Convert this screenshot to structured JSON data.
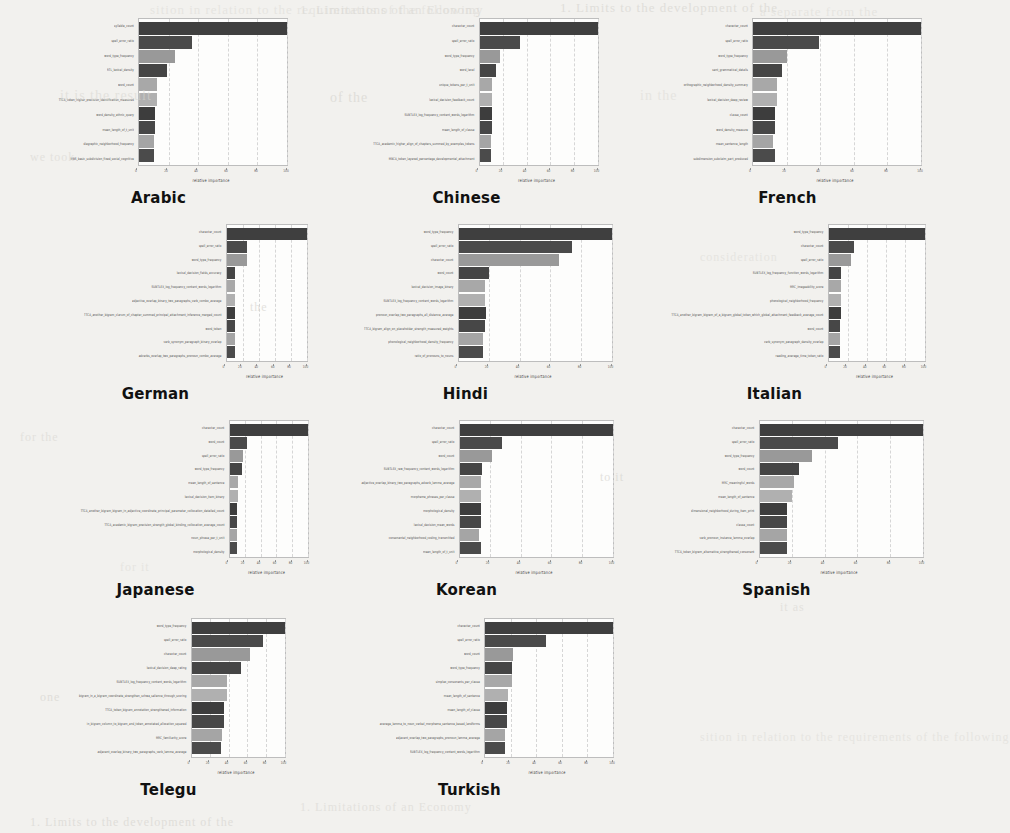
{
  "page": {
    "background_color": "#f2f1ee",
    "bleed_through_lines": [
      "sition in relation to the requirements of the following",
      "1. Limitations of an Economy",
      "1. Limits to the development of the",
      "a separate from the",
      "it is the result",
      "of the",
      "in the",
      "we took",
      "the",
      "consideration",
      "for the",
      "to it",
      "for it",
      "it as",
      "one"
    ]
  },
  "figure": {
    "type": "small-multiples",
    "n_panels": 11,
    "columns": 3,
    "shared_xlabel": "relative importance",
    "bar_palette": [
      "#3f3f3f",
      "#4a4a4a",
      "#999999",
      "#454545",
      "#a8a8a8",
      "#b0b0b0",
      "#3d3d3d",
      "#474747",
      "#a5a5a5",
      "#4b4b4b"
    ],
    "axis_color": "#bdbdbd",
    "grid_color": "#d6d6d6"
  },
  "chart_data": [
    {
      "type": "bar",
      "orientation": "horizontal",
      "title": "Arabic",
      "xlabel": "relative importance",
      "ylabel": "",
      "xlim": [
        0,
        100
      ],
      "xticks": [
        0,
        20,
        40,
        60,
        80,
        100
      ],
      "grid": true,
      "categories": [
        "syllable_count",
        "spell_error_ratio",
        "word_type_frequency",
        "RTL_lexical_density",
        "word_count",
        "TTCA_token_higher_precision_identification_measured",
        "word_density_ethnic_query",
        "mean_length_of_t_unit",
        "diagraphic_neighborhood_frequency",
        "MBS_basic_subdivision_fixed_social_cognitive"
      ],
      "values": [
        100,
        36,
        24,
        19,
        12,
        12,
        11,
        11,
        10,
        10
      ]
    },
    {
      "type": "bar",
      "orientation": "horizontal",
      "title": "Chinese",
      "xlabel": "relative importance",
      "ylabel": "",
      "xlim": [
        0,
        100
      ],
      "xticks": [
        0,
        20,
        40,
        60,
        80,
        100
      ],
      "grid": true,
      "categories": [
        "character_count",
        "spell_error_ratio",
        "word_type_frequency",
        "word_level",
        "unique_tokens_per_t_unit",
        "lexical_decision_feedback_count",
        "SUBTLEX_log_frequency_content_words_logarithm",
        "mean_length_of_clause",
        "TTCA_academic_higher_align_of_chapters_summed_by_examples_tokens",
        "MBCA_token_layered_percentage_developmental_attachment"
      ],
      "values": [
        100,
        34,
        17,
        14,
        11,
        11,
        11,
        11,
        10,
        10
      ]
    },
    {
      "type": "bar",
      "orientation": "horizontal",
      "title": "French",
      "xlabel": "relative importance",
      "ylabel": "",
      "xlim": [
        0,
        100
      ],
      "xticks": [
        0,
        20,
        40,
        60,
        80,
        100
      ],
      "grid": true,
      "categories": [
        "character_count",
        "spell_error_ratio",
        "word_type_frequency",
        "sent_grammatical_details",
        "orthographic_neighborhood_density_summary",
        "lexical_decision_deep_review",
        "clause_count",
        "word_density_measure",
        "mean_sentence_length",
        "subdimension_subclaim_part_produced"
      ],
      "values": [
        100,
        39,
        20,
        17,
        14,
        14,
        13,
        13,
        12,
        13
      ]
    },
    {
      "type": "bar",
      "orientation": "horizontal",
      "title": "German",
      "xlabel": "relative importance",
      "ylabel": "",
      "xlim": [
        0,
        100
      ],
      "xticks": [
        0,
        20,
        40,
        60,
        80,
        100
      ],
      "grid": true,
      "categories": [
        "character_count",
        "spell_error_ratio",
        "word_type_frequency",
        "lexical_decision_fields_accuracy",
        "SUBTLEX_log_frequency_content_words_logarithm",
        "adjective_overlap_binary_two_paragraphs_verb_combo_average",
        "TTCA_another_bigram_clarum_of_chapter_summed_principal_attachment_inference_merged_count",
        "word_token",
        "verb_synonym_paragraph_binary_overlap",
        "adverbs_overlap_two_paragraphs_pronoun_combo_average"
      ],
      "values": [
        100,
        26,
        25,
        11,
        11,
        11,
        11,
        11,
        10,
        10
      ]
    },
    {
      "type": "bar",
      "orientation": "horizontal",
      "title": "Hindi",
      "xlabel": "relative importance",
      "ylabel": "",
      "xlim": [
        0,
        100
      ],
      "xticks": [
        0,
        20,
        40,
        60,
        80,
        100
      ],
      "grid": true,
      "categories": [
        "word_type_frequency",
        "spell_error_ratio",
        "character_count",
        "word_count",
        "lexical_decision_image_binary",
        "SUBTLEX_log_frequency_content_words_logarithm",
        "pronoun_overlap_two_paragraphs_all_distance_average",
        "TTCA_bigram_align_on_placeholder_strength_measured_weights",
        "phonological_neighborhood_density_frequency",
        "ratio_of_pronouns_to_nouns"
      ],
      "values": [
        100,
        74,
        66,
        20,
        17,
        17,
        18,
        17,
        16,
        16
      ]
    },
    {
      "type": "bar",
      "orientation": "horizontal",
      "title": "Italian",
      "xlabel": "relative importance",
      "ylabel": "",
      "xlim": [
        0,
        100
      ],
      "xticks": [
        0,
        20,
        40,
        60,
        80,
        100
      ],
      "grid": true,
      "categories": [
        "word_type_frequency",
        "character_count",
        "spell_error_ratio",
        "SUBTLEX_log_frequency_function_words_logarithm",
        "MRC_imageability_score",
        "phonological_neighborhood_frequency",
        "TTCA_another_bigram_bigram_of_a_bigram_global_token_which_global_attachment_feedback_average_count",
        "word_count",
        "verb_synonym_paragraph_density_overlap",
        "reading_average_time_token_ratio"
      ],
      "values": [
        100,
        27,
        23,
        13,
        13,
        13,
        13,
        12,
        12,
        12
      ]
    },
    {
      "type": "bar",
      "orientation": "horizontal",
      "title": "Japanese",
      "xlabel": "relative importance",
      "ylabel": "",
      "xlim": [
        0,
        100
      ],
      "xticks": [
        0,
        20,
        40,
        60,
        80,
        100
      ],
      "grid": true,
      "categories": [
        "character_count",
        "word_count",
        "spell_error_ratio",
        "word_type_frequency",
        "mean_length_of_sentence",
        "lexical_decision_item_binary",
        "TTCA_another_bigram_bigram_in_adjective_coordinate_principal_parameter_collocation_detailed_count",
        "TTCA_academic_bigram_precision_strength_global_binding_collocation_average_count",
        "noun_phrase_per_t_unit",
        "morphological_density"
      ],
      "values": [
        100,
        22,
        17,
        16,
        11,
        11,
        10,
        10,
        10,
        10
      ]
    },
    {
      "type": "bar",
      "orientation": "horizontal",
      "title": "Korean",
      "xlabel": "relative importance",
      "ylabel": "",
      "xlim": [
        0,
        100
      ],
      "xticks": [
        0,
        20,
        40,
        60,
        80,
        100
      ],
      "grid": true,
      "categories": [
        "character_count",
        "spell_error_ratio",
        "word_count",
        "SUBTLEX_raw_frequency_content_words_logarithm",
        "adjective_overlap_binary_two_paragraphs_adverb_lemma_average",
        "morpheme_phrases_per_clause",
        "morphological_density",
        "lexical_decision_mean_words",
        "consonantal_neighborhood_coding_transmitted",
        "mean_length_of_t_unit"
      ],
      "values": [
        100,
        28,
        21,
        15,
        14,
        14,
        14,
        14,
        13,
        14
      ]
    },
    {
      "type": "bar",
      "orientation": "horizontal",
      "title": "Spanish",
      "xlabel": "relative importance",
      "ylabel": "",
      "xlim": [
        0,
        100
      ],
      "xticks": [
        0,
        20,
        40,
        60,
        80,
        100
      ],
      "grid": true,
      "categories": [
        "character_count",
        "spell_error_ratio",
        "word_type_frequency",
        "word_count",
        "MRC_meaningful_words",
        "mean_length_of_sentence",
        "dimensional_neighborhood_during_item_print",
        "clause_count",
        "verb_pronoun_instance_lemma_overlap",
        "TTCA_token_bigram_alternative_strengthened_consonant"
      ],
      "values": [
        100,
        48,
        32,
        24,
        21,
        20,
        17,
        17,
        17,
        17
      ]
    },
    {
      "type": "bar",
      "orientation": "horizontal",
      "title": "Telegu",
      "xlabel": "relative importance",
      "ylabel": "",
      "xlim": [
        0,
        100
      ],
      "xticks": [
        0,
        20,
        40,
        60,
        80,
        100
      ],
      "grid": true,
      "categories": [
        "word_type_frequency",
        "spell_error_ratio",
        "character_count",
        "lexical_decision_deep_rating",
        "SUBTLEX_log_frequency_content_words_logarithm",
        "bigram_in_a_bigram_coordinate_strengthen_schwa_salience_through_scoring",
        "TTCA_token_bigram_annotation_strengthened_information",
        "in_bigram_column_to_bigram_and_token_annotated_allocation_squared",
        "MRC_familiarity_score",
        "adjacent_overlap_binary_two_paragraphs_verb_lemma_average"
      ],
      "values": [
        100,
        77,
        63,
        53,
        38,
        38,
        35,
        35,
        33,
        32
      ]
    },
    {
      "type": "bar",
      "orientation": "horizontal",
      "title": "Turkish",
      "xlabel": "relative importance",
      "ylabel": "",
      "xlim": [
        0,
        100
      ],
      "xticks": [
        0,
        20,
        40,
        60,
        80,
        100
      ],
      "grid": true,
      "categories": [
        "character_count",
        "spell_error_ratio",
        "word_count",
        "word_type_frequency",
        "simplex_consonants_per_clause",
        "mean_length_of_sentence",
        "mean_length_of_clause",
        "average_lemma_to_noun_verbal_morpheme_sentence_based_landforms",
        "adjacent_overlap_two_paragraphs_pronoun_lemma_average",
        "SUBTLEX_log_frequency_content_words_logarithm"
      ],
      "values": [
        100,
        48,
        22,
        21,
        21,
        18,
        17,
        17,
        16,
        16
      ]
    }
  ]
}
